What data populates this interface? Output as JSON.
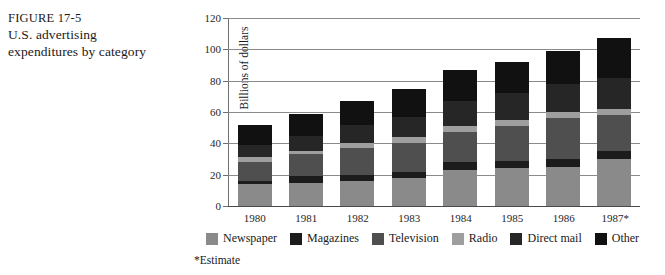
{
  "caption": {
    "figure_label": "FIGURE 17-5",
    "title_line1": "U.S. advertising",
    "title_line2": "expenditures by category"
  },
  "chart_data": {
    "type": "bar",
    "stacked": true,
    "title": "U.S. advertising expenditures by category",
    "xlabel": "",
    "ylabel": "Billions of dollars",
    "ylim": [
      0,
      120
    ],
    "yticks": [
      0,
      20,
      40,
      60,
      80,
      100,
      120
    ],
    "ytick_labels": [
      "0",
      "20",
      "40",
      "60",
      "80",
      "100",
      "120"
    ],
    "grid": true,
    "grid_axis": "y",
    "legend_position": "bottom",
    "categories": [
      "1980",
      "1981",
      "1982",
      "1983",
      "1984",
      "1985",
      "1986",
      "1987*"
    ],
    "series": [
      {
        "name": "Newspaper",
        "color": "#8a8a8a",
        "values": [
          14,
          15,
          16,
          18,
          23,
          24,
          25,
          30
        ]
      },
      {
        "name": "Magazines",
        "color": "#1c1c1c",
        "values": [
          2,
          4,
          4,
          4,
          5,
          5,
          5,
          5
        ]
      },
      {
        "name": "Television",
        "color": "#4f4f4f",
        "values": [
          12,
          14,
          17,
          18,
          19,
          22,
          26,
          23
        ]
      },
      {
        "name": "Radio",
        "color": "#9e9e9e",
        "values": [
          3,
          2,
          3,
          4,
          4,
          4,
          4,
          4
        ]
      },
      {
        "name": "Direct mail",
        "color": "#262626",
        "values": [
          8,
          10,
          12,
          13,
          16,
          17,
          18,
          20
        ]
      },
      {
        "name": "Other",
        "color": "#111111",
        "values": [
          13,
          14,
          15,
          18,
          20,
          20,
          21,
          25
        ]
      }
    ],
    "totals": [
      52,
      59,
      67,
      75,
      87,
      92,
      99,
      107
    ],
    "annotations": [
      "*Estimate"
    ]
  },
  "legend": {
    "items": [
      {
        "label": "Newspaper",
        "color": "#8a8a8a"
      },
      {
        "label": "Magazines",
        "color": "#1c1c1c"
      },
      {
        "label": "Television",
        "color": "#4f4f4f"
      },
      {
        "label": "Radio",
        "color": "#9e9e9e"
      },
      {
        "label": "Direct mail",
        "color": "#262626"
      },
      {
        "label": "Other",
        "color": "#111111"
      }
    ]
  },
  "footnote": {
    "text": "*Estimate"
  }
}
